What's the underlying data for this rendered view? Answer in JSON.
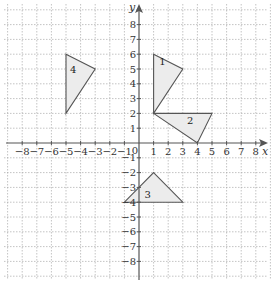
{
  "diagram": {
    "type": "coordinate-grid",
    "x_axis_label": "x",
    "y_axis_label": "y",
    "origin_label": "0",
    "x_range": [
      -8,
      8
    ],
    "y_range": [
      -8,
      8
    ],
    "x_ticks": [
      "-8",
      "-7",
      "-6",
      "-5",
      "-4",
      "-3",
      "-2",
      "-1",
      "1",
      "2",
      "3",
      "4",
      "5",
      "6",
      "7",
      "8"
    ],
    "y_ticks": [
      "8",
      "7",
      "6",
      "5",
      "4",
      "3",
      "2",
      "1",
      "-1",
      "-2",
      "-3",
      "-4",
      "-5",
      "-6",
      "-7",
      "-8"
    ],
    "shape_fill": "#ececec",
    "shape_stroke": "#555555",
    "triangles": [
      {
        "label": "1",
        "vertices": [
          [
            1,
            6
          ],
          [
            3,
            5
          ],
          [
            1,
            2
          ]
        ]
      },
      {
        "label": "2",
        "vertices": [
          [
            1,
            2
          ],
          [
            5,
            2
          ],
          [
            4,
            0
          ]
        ]
      },
      {
        "label": "3",
        "vertices": [
          [
            1,
            -2
          ],
          [
            3,
            -4
          ],
          [
            -1,
            -4
          ]
        ]
      },
      {
        "label": "4",
        "vertices": [
          [
            -5,
            6
          ],
          [
            -3,
            5
          ],
          [
            -5,
            2
          ]
        ]
      }
    ]
  }
}
